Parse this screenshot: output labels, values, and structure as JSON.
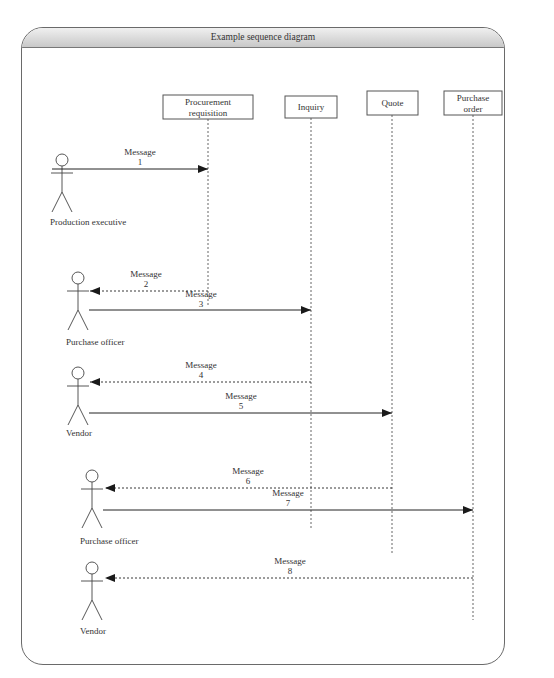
{
  "title": "Example sequence diagram",
  "objects": [
    {
      "id": "procurement",
      "label_lines": [
        "Procurement",
        "requisition"
      ],
      "x": 208,
      "box": [
        163,
        95,
        90,
        24
      ],
      "lifeline_end": 305
    },
    {
      "id": "inquiry",
      "label_lines": [
        "Inquiry"
      ],
      "x": 311,
      "box": [
        285,
        96,
        52,
        22
      ],
      "lifeline_end": 528
    },
    {
      "id": "quote",
      "label_lines": [
        "Quote"
      ],
      "x": 392,
      "box": [
        367,
        91,
        51,
        24
      ],
      "lifeline_end": 555
    },
    {
      "id": "purchase_order",
      "label_lines": [
        "Purchase",
        "order"
      ],
      "x": 473,
      "box": [
        444,
        91,
        58,
        24
      ],
      "lifeline_end": 620
    }
  ],
  "actors": [
    {
      "label": "Production executive",
      "x": 62,
      "head_y": 160,
      "label_y": 225
    },
    {
      "label": "Purchase officer",
      "x": 78,
      "head_y": 278,
      "label_y": 345
    },
    {
      "label": "Vendor",
      "x": 78,
      "head_y": 373,
      "label_y": 436
    },
    {
      "label": "Purchase officer",
      "x": 92,
      "head_y": 476,
      "label_y": 544
    },
    {
      "label": "Vendor",
      "x": 92,
      "head_y": 568,
      "label_y": 634
    }
  ],
  "messages": [
    {
      "label": "Message",
      "number": "1",
      "from_x": 52,
      "to_x": 208,
      "y": 169,
      "style": "solid",
      "label_x": 140,
      "label_y": 155
    },
    {
      "label": "Message",
      "number": "2",
      "from_x": 208,
      "to_x": 90,
      "y": 291,
      "style": "dashed",
      "label_x": 146,
      "label_y": 277
    },
    {
      "label": "Message",
      "number": "3",
      "from_x": 89,
      "to_x": 311,
      "y": 310,
      "style": "solid",
      "label_x": 201,
      "label_y": 297
    },
    {
      "label": "Message",
      "number": "4",
      "from_x": 311,
      "to_x": 90,
      "y": 382,
      "style": "dashed",
      "label_x": 201,
      "label_y": 368
    },
    {
      "label": "Message",
      "number": "5",
      "from_x": 89,
      "to_x": 392,
      "y": 413,
      "style": "solid",
      "label_x": 241,
      "label_y": 399
    },
    {
      "label": "Message",
      "number": "6",
      "from_x": 392,
      "to_x": 105,
      "y": 488,
      "style": "dashed",
      "label_x": 248,
      "label_y": 474
    },
    {
      "label": "Message",
      "number": "7",
      "from_x": 103,
      "to_x": 473,
      "y": 510,
      "style": "solid",
      "label_x": 288,
      "label_y": 496
    },
    {
      "label": "Message",
      "number": "8",
      "from_x": 473,
      "to_x": 105,
      "y": 578,
      "style": "dashed",
      "label_x": 290,
      "label_y": 564
    }
  ]
}
